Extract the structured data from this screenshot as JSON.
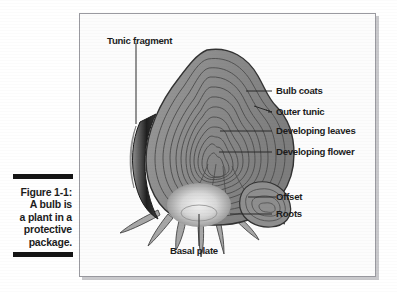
{
  "figure": {
    "number": "Figure 1-1:",
    "caption_lines": [
      "A bulb is",
      "a plant in a",
      "protective",
      "package."
    ],
    "full_caption": "Figure 1-1: A bulb is a plant in a protective package."
  },
  "diagram": {
    "labels": [
      {
        "id": "tunic-fragment",
        "text": "Tunic fragment",
        "side": "top"
      },
      {
        "id": "bulb-coats",
        "text": "Bulb coats",
        "side": "right"
      },
      {
        "id": "outer-tunic",
        "text": "Outer tunic",
        "side": "right"
      },
      {
        "id": "developing-leaves",
        "text": "Developing leaves",
        "side": "right"
      },
      {
        "id": "developing-flower",
        "text": "Developing flower",
        "side": "right"
      },
      {
        "id": "offset",
        "text": "Offset",
        "side": "right"
      },
      {
        "id": "roots",
        "text": "Roots",
        "side": "right"
      },
      {
        "id": "basal-plate",
        "text": "Basal plate",
        "side": "bottom"
      }
    ]
  },
  "colors": {
    "page_background": "#ffffff",
    "frame_background": "#fcfcfc",
    "frame_border": "#9a9aa0",
    "rule_bar": "#151515",
    "text": "#1c1c1c",
    "bulb_body": "#8b8b8b",
    "bulb_body_light": "#a3a3a3",
    "bulb_outline": "#3a3a3a",
    "contour_line": "#555555",
    "tunic_dark": "#262626",
    "basal_plate": "#e4e4e4",
    "root": "#9b9b9b",
    "leader_line": "#2a2a2a"
  }
}
